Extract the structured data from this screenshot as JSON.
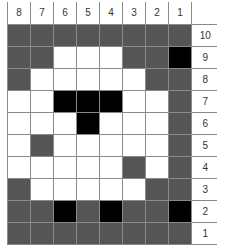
{
  "grid": {
    "column_labels": [
      "8",
      "7",
      "6",
      "5",
      "4",
      "3",
      "2",
      "1"
    ],
    "rows": [
      {
        "label": "10",
        "cells": [
          "g",
          "g",
          "g",
          "g",
          "g",
          "g",
          "g",
          "g"
        ]
      },
      {
        "label": "9",
        "cells": [
          "g",
          "g",
          "w",
          "w",
          "w",
          "g",
          "g",
          "b"
        ]
      },
      {
        "label": "8",
        "cells": [
          "g",
          "w",
          "w",
          "w",
          "w",
          "w",
          "g",
          "g"
        ]
      },
      {
        "label": "7",
        "cells": [
          "w",
          "w",
          "b",
          "b",
          "b",
          "w",
          "w",
          "g"
        ]
      },
      {
        "label": "6",
        "cells": [
          "w",
          "w",
          "w",
          "b",
          "w",
          "w",
          "w",
          "g"
        ]
      },
      {
        "label": "5",
        "cells": [
          "w",
          "g",
          "w",
          "w",
          "w",
          "w",
          "w",
          "g"
        ]
      },
      {
        "label": "4",
        "cells": [
          "w",
          "w",
          "w",
          "w",
          "w",
          "g",
          "w",
          "g"
        ]
      },
      {
        "label": "3",
        "cells": [
          "g",
          "w",
          "w",
          "w",
          "w",
          "w",
          "g",
          "g"
        ]
      },
      {
        "label": "2",
        "cells": [
          "g",
          "g",
          "b",
          "g",
          "b",
          "g",
          "g",
          "b"
        ]
      },
      {
        "label": "1",
        "cells": [
          "g",
          "g",
          "g",
          "g",
          "g",
          "g",
          "g",
          "g"
        ]
      }
    ],
    "legend": {
      "w": "white",
      "g": "gray",
      "b": "black"
    },
    "colors": {
      "white": "#ffffff",
      "gray": "#555555",
      "black": "#000000",
      "line": "#8a8a8a"
    }
  }
}
